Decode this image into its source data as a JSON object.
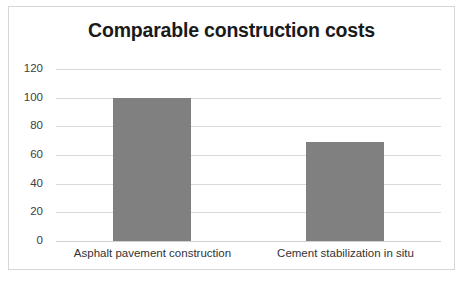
{
  "chart_data": {
    "type": "bar",
    "title": "Comparable construction costs",
    "xlabel": "",
    "ylabel": "",
    "categories": [
      "Asphalt pavement construction",
      "Cement stabilization in situ"
    ],
    "values": [
      100,
      69
    ],
    "ylim": [
      0,
      120
    ],
    "yticks": [
      0,
      20,
      40,
      60,
      80,
      100,
      120
    ],
    "ytick_labels": [
      "0",
      "20",
      "40",
      "60",
      "80",
      "100",
      "120"
    ],
    "grid": true,
    "legend": null,
    "legend_position": "none",
    "bar_color": "#808080",
    "gridline_color": "#d9d9d9",
    "frame_border_color": "#d6d6d6",
    "background_color": "#ffffff"
  }
}
